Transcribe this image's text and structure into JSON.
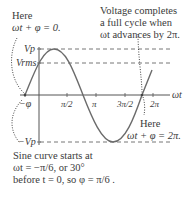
{
  "annotations": {
    "top_left_line1": "Here",
    "top_left_line2": "ωt + φ = 0.",
    "top_right_line1": "Voltage completes",
    "top_right_line2": "a full cycle when",
    "top_right_line3": "ωt advances by 2π.",
    "bottom_right_line1": "Here",
    "bottom_right_line2": "ωt + φ = 2π.",
    "bottom_left_line1": "Sine curve starts at",
    "bottom_left_line2": "ωt = −π/6, or 30°",
    "bottom_left_line3": "before t = 0, so φ = π/6 ."
  },
  "axes": {
    "x_label": "ωt",
    "y_labels": {
      "vp": "Vp",
      "vrms": "Vrms",
      "neg_vp": "−Vp"
    },
    "neg_phi_label": "−φ",
    "x_ticks": [
      "π/2",
      "π",
      "3π/2",
      "2π"
    ]
  },
  "colors": {
    "curve": "#6b6b6b",
    "axis": "#555555",
    "text": "#3a3a3a"
  }
}
